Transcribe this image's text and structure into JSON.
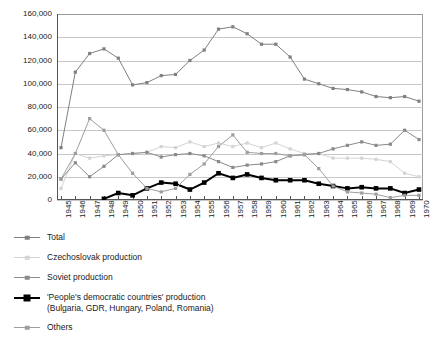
{
  "chart_data": {
    "type": "line",
    "title": "",
    "xlabel": "",
    "ylabel": "",
    "x": [
      1945,
      1946,
      1947,
      1948,
      1949,
      1950,
      1951,
      1952,
      1953,
      1954,
      1955,
      1956,
      1957,
      1958,
      1959,
      1960,
      1961,
      1962,
      1963,
      1964,
      1965,
      1966,
      1967,
      1968,
      1969,
      1970
    ],
    "xtick_labels": [
      "1945",
      "1946",
      "1947",
      "1948",
      "1949",
      "1950",
      "1951",
      "1952",
      "1953",
      "1954",
      "1955",
      "1956",
      "1957",
      "1958",
      "1959",
      "1960",
      "1961",
      "1962",
      "1963",
      "1964",
      "1965",
      "1966",
      "1967",
      "1968",
      "1969",
      "1970"
    ],
    "ylim": [
      0,
      160000
    ],
    "ytick_values": [
      0,
      20000,
      40000,
      60000,
      80000,
      100000,
      120000,
      140000,
      160000
    ],
    "ytick_labels": [
      "0",
      "20,000",
      "40,000",
      "60,000",
      "80,000",
      "100,000",
      "120,000",
      "140,000",
      "160,000"
    ],
    "grid": true,
    "legend_position": "below",
    "series": [
      {
        "name": "Total",
        "color": "#808080",
        "marker": "square",
        "values": [
          45000,
          110000,
          126000,
          130000,
          122000,
          99000,
          101000,
          107000,
          108000,
          120000,
          129000,
          147000,
          149000,
          143000,
          134000,
          134000,
          123000,
          104000,
          100000,
          96000,
          95000,
          93000,
          89000,
          88000,
          89000,
          85000
        ]
      },
      {
        "name": "Czechoslovak production",
        "color": "#d4d4d4",
        "marker": "square",
        "values": [
          10000,
          40000,
          36000,
          38000,
          39000,
          40000,
          41000,
          46000,
          45000,
          50000,
          46000,
          49000,
          46000,
          49000,
          45000,
          49000,
          44000,
          40000,
          40000,
          36000,
          36000,
          36000,
          35000,
          33000,
          23000,
          20000
        ]
      },
      {
        "name": "Soviet production",
        "color": "#8a8a8a",
        "marker": "square",
        "values": [
          18000,
          32000,
          20000,
          29000,
          39000,
          40000,
          41000,
          37000,
          39000,
          40000,
          38000,
          33000,
          28000,
          30000,
          31000,
          33000,
          38000,
          39000,
          40000,
          44000,
          47000,
          50000,
          47000,
          48000,
          60000,
          52000
        ]
      },
      {
        "name": "'People's democratic countries' production\n(Bulgaria, GDR, Hungary, Poland, Romania)",
        "color": "#000000",
        "marker": "square-large",
        "values": [
          null,
          null,
          null,
          1000,
          6000,
          4000,
          10000,
          15000,
          14000,
          9000,
          15000,
          23000,
          19000,
          22000,
          19000,
          17000,
          17000,
          17000,
          14000,
          12000,
          10000,
          11000,
          10000,
          10000,
          6000,
          9000
        ]
      },
      {
        "name": "Others",
        "color": "#9e9e9e",
        "marker": "square",
        "values": [
          18000,
          40000,
          70000,
          60000,
          39000,
          23000,
          10000,
          7000,
          10000,
          22000,
          31000,
          46000,
          56000,
          41000,
          40000,
          40000,
          38000,
          39000,
          27000,
          12000,
          7000,
          6000,
          5000,
          2000,
          4000,
          4000
        ]
      }
    ]
  },
  "legend": {
    "entries": [
      {
        "label": "Total"
      },
      {
        "label": "Czechoslovak production"
      },
      {
        "label": "Soviet production"
      },
      {
        "label": "'People's democratic countries' production\n(Bulgaria, GDR, Hungary, Poland, Romania)"
      },
      {
        "label": "Others"
      }
    ]
  }
}
